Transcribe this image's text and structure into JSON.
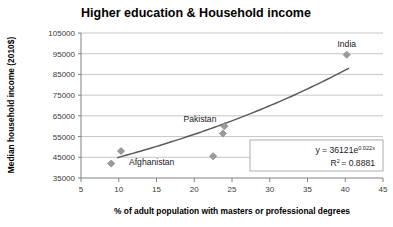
{
  "chart_data": {
    "type": "scatter",
    "title": "Higher education & Household income",
    "xlabel": "% of adult population with masters or professional degrees",
    "ylabel": "Median household income (2010$)",
    "xlim": [
      5,
      45
    ],
    "ylim": [
      35000,
      105000
    ],
    "xticks": [
      "5",
      "10",
      "15",
      "20",
      "25",
      "30",
      "35",
      "40",
      "45"
    ],
    "yticks": [
      "35000",
      "45000",
      "55000",
      "65000",
      "75000",
      "85000",
      "95000",
      "105000"
    ],
    "grid": "horizontal",
    "legend": "none",
    "marker_color": "#9a9a9a",
    "trendline_color": "#5a5a5a",
    "points": [
      {
        "label": "Afghanistan",
        "x": 10.3,
        "y": 48000
      },
      {
        "label": "",
        "x": 9.0,
        "y": 42000
      },
      {
        "label": "",
        "x": 22.5,
        "y": 45500
      },
      {
        "label": "Pakistan",
        "x": 24.0,
        "y": 60000
      },
      {
        "label": "",
        "x": 23.8,
        "y": 56500
      },
      {
        "label": "India",
        "x": 40.2,
        "y": 94500
      }
    ],
    "annotations": {
      "equation_main": "y = 36121e",
      "equation_exponent": "0.022x",
      "r_squared_main": "R",
      "r_squared_sup": "2",
      "r_squared_value": "= 0.8881"
    },
    "point_labels": {
      "afghanistan": "Afghanistan",
      "pakistan": "Pakistan",
      "india": "India"
    }
  }
}
